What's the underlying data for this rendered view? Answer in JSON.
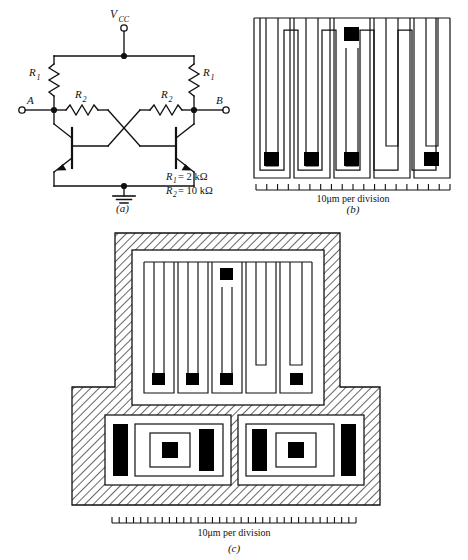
{
  "figure": {
    "panels": [
      {
        "id": "a",
        "caption": "(a)",
        "type": "schematic"
      },
      {
        "id": "b",
        "caption": "(b)",
        "type": "resistor-mask-layout"
      },
      {
        "id": "c",
        "caption": "(c)",
        "type": "full-chip-layout"
      }
    ]
  },
  "circuit": {
    "supply_label": "V",
    "supply_subscript": "CC",
    "terminal_left": "A",
    "terminal_right": "B",
    "resistor_labels": {
      "r1": "R",
      "r1_sub": "1",
      "r2": "R",
      "r2_sub": "2"
    },
    "values": [
      {
        "symbol": "R",
        "subscript": "1",
        "equals": "= 2 kΩ"
      },
      {
        "symbol": "R",
        "subscript": "2",
        "equals": "= 10 kΩ"
      }
    ],
    "value_lines": [
      "R1 = 2 kΩ",
      "R2 = 10 kΩ"
    ],
    "components": {
      "transistors": 2,
      "resistors_r1": 2,
      "resistors_r2": 2,
      "ground_symbol": "ground-icon"
    }
  },
  "panel_b": {
    "caption": "(b)",
    "scale_text": "10μm per division",
    "scale_divisions": 18,
    "contact_pads": 5,
    "pad_positions": [
      "top-center",
      "bottom-1",
      "bottom-2",
      "bottom-3",
      "bottom-4"
    ],
    "meander_fingers": 5
  },
  "panel_c": {
    "caption": "(c)",
    "scale_text": "10μm per division",
    "scale_divisions": 34,
    "resistor_pads": 5,
    "transistor_count": 2,
    "transistor_parts": [
      "emitter-stripe-left",
      "base-window",
      "collector-contact",
      "emitter-stripe-right"
    ],
    "isolation_region": "hatched"
  },
  "colors": {
    "line": "#111111",
    "fill_black": "#000000",
    "background": "#ffffff",
    "hatch": "#444444"
  }
}
